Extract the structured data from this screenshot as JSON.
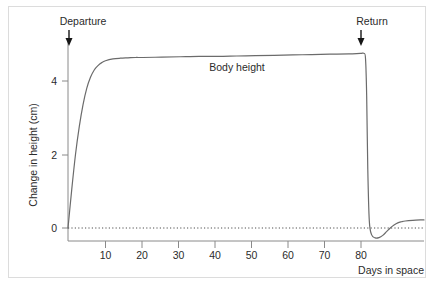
{
  "figure": {
    "background_color": "#ffffff",
    "frame_color": "#dcdcdc",
    "text_color": "#2b2b2b",
    "curve_color": "#6b6b6b",
    "axis_color": "#8a8a8a"
  },
  "chart_data": {
    "type": "line",
    "title": "",
    "subtitle": "",
    "xlabel": "Days in space",
    "ylabel": "Change in height (cm)",
    "xlim": [
      0,
      95
    ],
    "ylim": [
      -0.55,
      5.2
    ],
    "xticks": [
      10,
      20,
      30,
      40,
      50,
      60,
      70,
      80
    ],
    "xtick_labels": [
      "10",
      "20",
      "30",
      "40",
      "50",
      "60",
      "70",
      "80"
    ],
    "yticks": [
      0,
      2,
      4
    ],
    "ytick_labels": [
      "0",
      "2",
      "4"
    ],
    "grid": false,
    "legend": "none",
    "zero_reference_line": {
      "value": 0,
      "style": "dotted",
      "label": ""
    },
    "annotations": [
      {
        "name": "departure",
        "text": "Departure",
        "x": 0,
        "marker": "down-arrow"
      },
      {
        "name": "return",
        "text": "Return",
        "x": 80,
        "marker": "down-arrow"
      },
      {
        "name": "series-label",
        "text": "Body height",
        "x": 41,
        "y": 4.95
      }
    ],
    "series": [
      {
        "name": "Body height",
        "x": [
          0,
          1,
          2,
          3,
          4,
          5,
          6,
          7,
          8,
          9,
          10,
          12,
          14,
          16,
          18,
          20,
          25,
          30,
          35,
          40,
          45,
          50,
          55,
          60,
          65,
          70,
          75,
          78,
          79,
          79.4,
          79.7,
          80,
          80.4,
          81,
          82,
          83,
          84,
          85,
          86,
          87,
          88,
          89,
          90,
          92,
          94,
          95
        ],
        "y": [
          0,
          1.05,
          2.0,
          2.75,
          3.35,
          3.8,
          4.1,
          4.3,
          4.42,
          4.5,
          4.55,
          4.6,
          4.62,
          4.63,
          4.64,
          4.64,
          4.65,
          4.66,
          4.67,
          4.67,
          4.68,
          4.69,
          4.7,
          4.71,
          4.72,
          4.73,
          4.74,
          4.75,
          4.75,
          4.6,
          3.6,
          1.6,
          0.2,
          -0.18,
          -0.27,
          -0.26,
          -0.2,
          -0.1,
          0.0,
          0.08,
          0.14,
          0.17,
          0.19,
          0.21,
          0.22,
          0.22
        ]
      }
    ]
  }
}
